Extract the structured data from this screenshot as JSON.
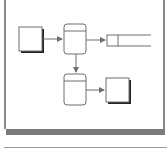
{
  "diagram": {
    "type": "data-flow-diagram",
    "nodes": [
      {
        "id": "entity-source",
        "kind": "external-entity",
        "label": ""
      },
      {
        "id": "process-1",
        "kind": "process",
        "label": ""
      },
      {
        "id": "data-store",
        "kind": "data-store",
        "label": ""
      },
      {
        "id": "process-2",
        "kind": "process",
        "label": ""
      },
      {
        "id": "entity-sink",
        "kind": "external-entity",
        "label": ""
      }
    ],
    "edges": [
      {
        "from": "entity-source",
        "to": "process-1"
      },
      {
        "from": "process-1",
        "to": "data-store"
      },
      {
        "from": "process-1",
        "to": "process-2"
      },
      {
        "from": "process-2",
        "to": "entity-sink"
      }
    ],
    "colors": {
      "stroke": "#6e6e6e",
      "shadow": "#222222",
      "frame": "#8a8a8a"
    }
  }
}
